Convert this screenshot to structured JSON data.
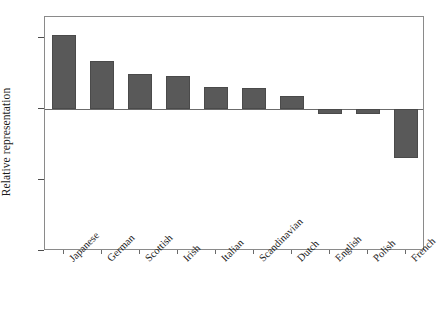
{
  "chart_data": {
    "type": "bar",
    "title": "",
    "xlabel": "",
    "ylabel": "Relative representation",
    "yscale": "log",
    "ylim": [
      0.25,
      2.45
    ],
    "baseline": 1.0,
    "grid": false,
    "legend": null,
    "ytick_labels": [
      "2.0",
      "1.0",
      "0.5",
      "0.25"
    ],
    "ytick_values": [
      2.0,
      1.0,
      0.5,
      0.25
    ],
    "categories": [
      "Japanese",
      "German",
      "Scottish",
      "Irish",
      "Italian",
      "Scandinavian",
      "Dutch",
      "English",
      "Polish",
      "French"
    ],
    "values": [
      2.05,
      1.6,
      1.4,
      1.38,
      1.24,
      1.22,
      1.13,
      0.95,
      0.95,
      0.62
    ]
  },
  "style": {
    "bar_color": "#595959",
    "bar_edge_color": "#4a4a4a",
    "frame_color": "#8a8a8a",
    "axis_color": "#6b6b6b",
    "text_color": "#1a1a1a",
    "background": "#ffffff"
  }
}
